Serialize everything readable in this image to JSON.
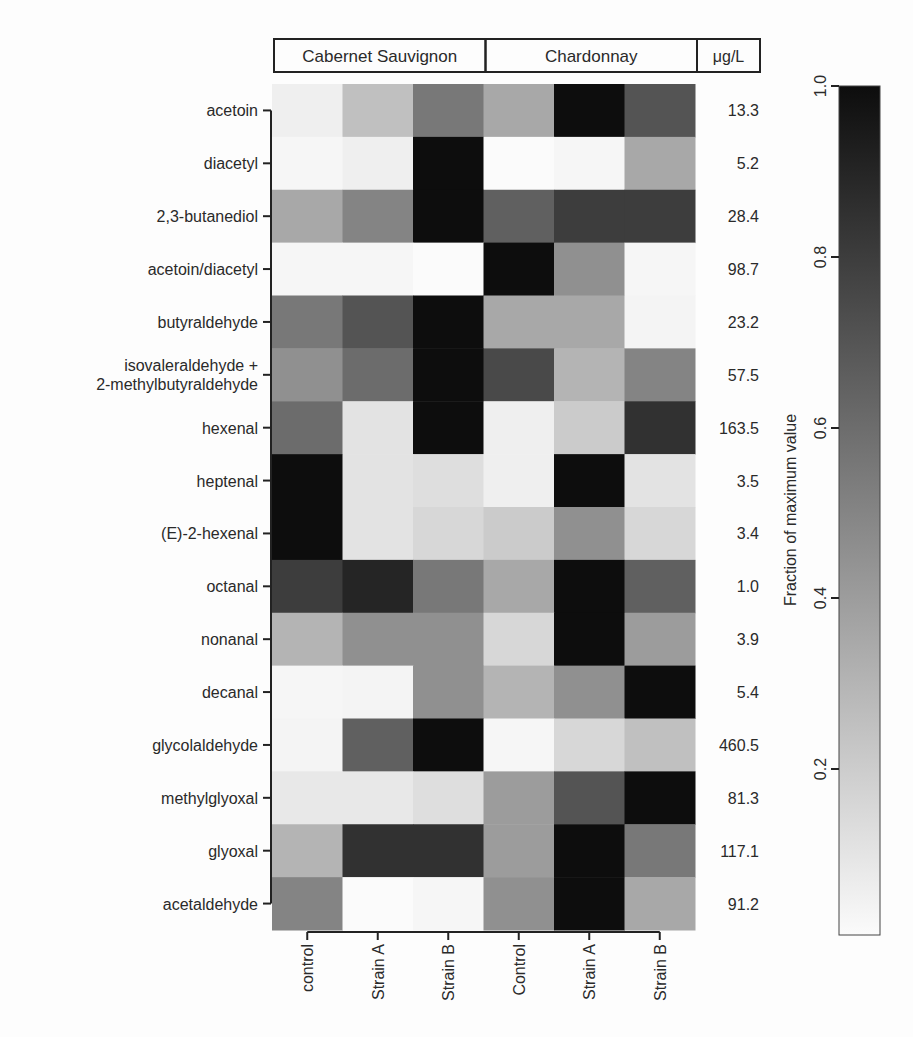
{
  "chart_data": {
    "type": "heatmap",
    "title": "",
    "column_groups": [
      {
        "label": "Cabernet Sauvignon",
        "span": 3
      },
      {
        "label": "Chardonnay",
        "span": 3
      }
    ],
    "unit_header": "μg/L",
    "columns": [
      "control",
      "Strain A",
      "Strain B",
      "Control",
      "Strain A",
      "Strain B"
    ],
    "rows": [
      {
        "label": [
          "acetoin"
        ],
        "max_ugL": "13.3",
        "values": [
          0.05,
          0.25,
          0.55,
          0.35,
          1.0,
          0.7
        ]
      },
      {
        "label": [
          "diacetyl"
        ],
        "max_ugL": "5.2",
        "values": [
          0.02,
          0.05,
          1.0,
          0.0,
          0.02,
          0.35
        ]
      },
      {
        "label": [
          "2,3-butanediol"
        ],
        "max_ugL": "28.4",
        "values": [
          0.35,
          0.5,
          1.0,
          0.65,
          0.8,
          0.8
        ]
      },
      {
        "label": [
          "acetoin/diacetyl"
        ],
        "max_ugL": "98.7",
        "values": [
          0.02,
          0.02,
          0.0,
          1.0,
          0.45,
          0.02
        ]
      },
      {
        "label": [
          "butyraldehyde"
        ],
        "max_ugL": "23.2",
        "values": [
          0.55,
          0.7,
          1.0,
          0.35,
          0.35,
          0.03
        ]
      },
      {
        "label": [
          "isovaleraldehyde +",
          "2-methylbutyraldehyde"
        ],
        "max_ugL": "57.5",
        "values": [
          0.45,
          0.6,
          1.0,
          0.75,
          0.3,
          0.5
        ]
      },
      {
        "label": [
          "hexenal"
        ],
        "max_ugL": "163.5",
        "values": [
          0.6,
          0.1,
          1.0,
          0.05,
          0.2,
          0.85
        ]
      },
      {
        "label": [
          "heptenal"
        ],
        "max_ugL": "3.5",
        "values": [
          1.0,
          0.1,
          0.12,
          0.05,
          1.0,
          0.1
        ]
      },
      {
        "label": [
          "(E)-2-hexenal"
        ],
        "max_ugL": "3.4",
        "values": [
          1.0,
          0.1,
          0.15,
          0.2,
          0.45,
          0.15
        ]
      },
      {
        "label": [
          "octanal"
        ],
        "max_ugL": "1.0",
        "values": [
          0.8,
          0.9,
          0.55,
          0.35,
          1.0,
          0.65
        ]
      },
      {
        "label": [
          "nonanal"
        ],
        "max_ugL": "3.9",
        "values": [
          0.3,
          0.45,
          0.45,
          0.15,
          1.0,
          0.4
        ]
      },
      {
        "label": [
          "decanal"
        ],
        "max_ugL": "5.4",
        "values": [
          0.02,
          0.03,
          0.45,
          0.3,
          0.45,
          1.0
        ]
      },
      {
        "label": [
          "glycolaldehyde"
        ],
        "max_ugL": "460.5",
        "values": [
          0.03,
          0.65,
          1.0,
          0.02,
          0.15,
          0.25
        ]
      },
      {
        "label": [
          "methylglyoxal"
        ],
        "max_ugL": "81.3",
        "values": [
          0.08,
          0.08,
          0.12,
          0.4,
          0.7,
          1.0
        ]
      },
      {
        "label": [
          "glyoxal"
        ],
        "max_ugL": "117.1",
        "values": [
          0.3,
          0.85,
          0.85,
          0.4,
          1.0,
          0.55
        ]
      },
      {
        "label": [
          "acetaldehyde"
        ],
        "max_ugL": "91.2",
        "values": [
          0.5,
          0.0,
          0.02,
          0.45,
          1.0,
          0.35
        ]
      }
    ],
    "colorbar": {
      "label": "Fraction of maximum value",
      "range": [
        0,
        1.0
      ],
      "ticks": [
        "0.2",
        "0.4",
        "0.6",
        "0.8",
        "1.0"
      ],
      "low_color": "#fbfbfb",
      "high_color": "#0d0d0d"
    },
    "xlabel": "",
    "ylabel": ""
  }
}
